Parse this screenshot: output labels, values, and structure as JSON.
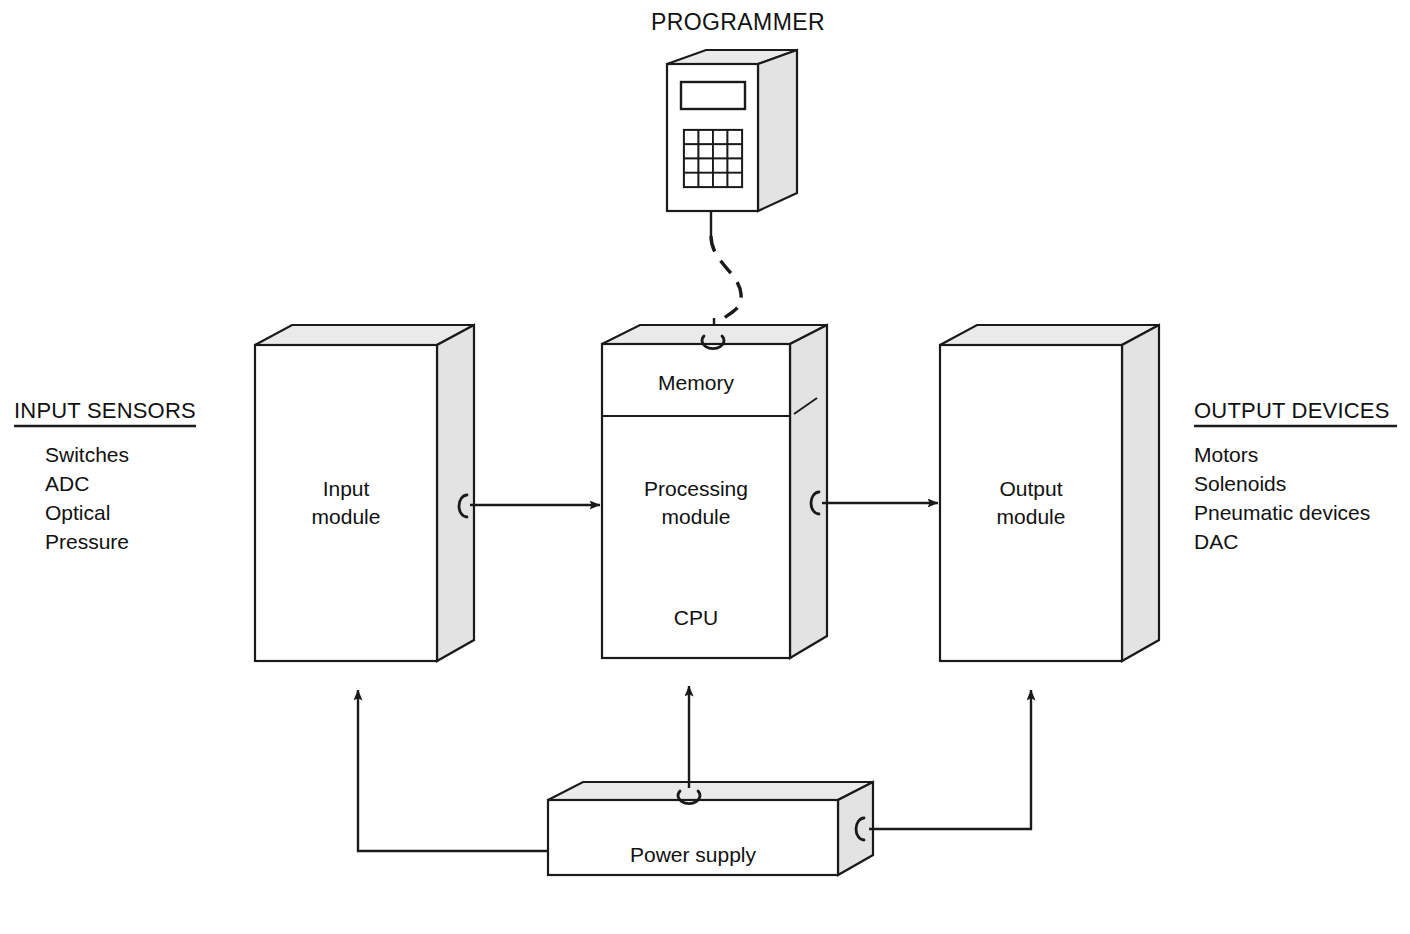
{
  "diagram": {
    "programmer": {
      "label": "PROGRAMMER",
      "connection_type": "dashed-cable",
      "has_display": true,
      "keypad_rows": 4,
      "keypad_cols": 4
    },
    "input_panel": {
      "heading": "INPUT SENSORS",
      "items": [
        "Switches",
        "ADC",
        "Optical",
        "Pressure"
      ]
    },
    "output_panel": {
      "heading": "OUTPUT DEVICES",
      "items": [
        "Motors",
        "Solenoids",
        "Pneumatic devices",
        "DAC"
      ]
    },
    "modules": {
      "input": {
        "label_line1": "Input",
        "label_line2": "module"
      },
      "processing": {
        "memory_label": "Memory",
        "label_line1": "Processing",
        "label_line2": "module",
        "cpu_label": "CPU"
      },
      "output": {
        "label_line1": "Output",
        "label_line2": "module"
      },
      "power": {
        "label": "Power supply"
      }
    },
    "connections": [
      {
        "from": "input module",
        "to": "processing module",
        "style": "solid-arrow"
      },
      {
        "from": "processing module",
        "to": "output module",
        "style": "solid-arrow"
      },
      {
        "from": "programmer",
        "to": "processing module",
        "style": "dashed-arrow"
      },
      {
        "from": "power supply",
        "to": "input module",
        "style": "solid-arrow"
      },
      {
        "from": "power supply",
        "to": "processing module",
        "style": "solid-arrow"
      },
      {
        "from": "power supply",
        "to": "output module",
        "style": "solid-arrow"
      }
    ],
    "colors": {
      "stroke": "#1a1a1a",
      "front_face": "#ffffff",
      "side_face": "#e3e3e3",
      "top_face": "#eaeaea",
      "background": "#ffffff"
    }
  }
}
